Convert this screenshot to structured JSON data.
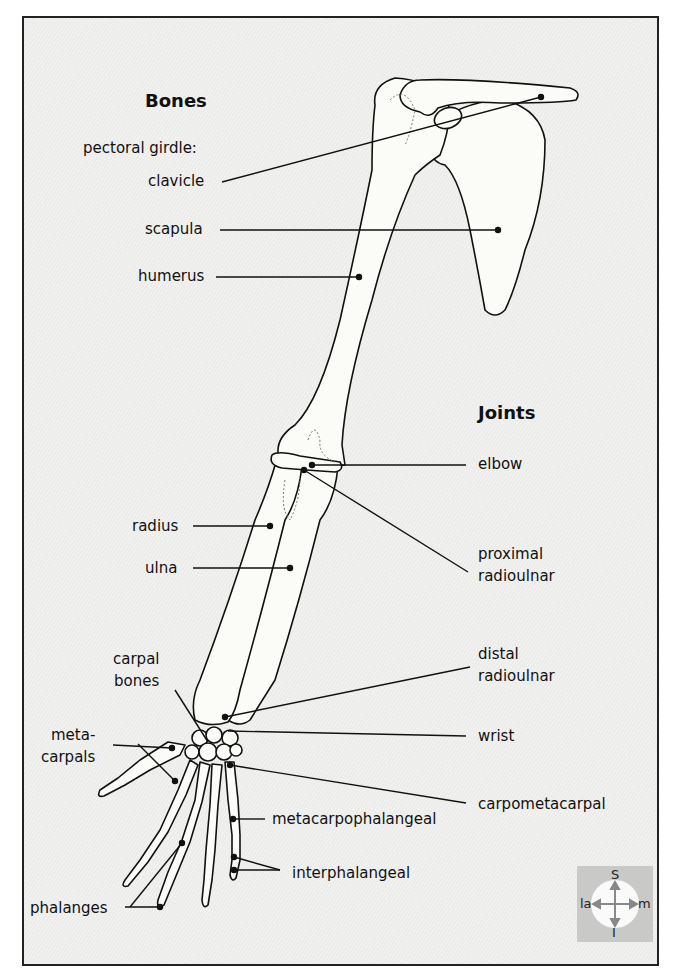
{
  "headers": {
    "bones": "Bones",
    "joints": "Joints"
  },
  "bones": {
    "pectoral_girdle": "pectoral girdle:",
    "clavicle": "clavicle",
    "scapula": "scapula",
    "humerus": "humerus",
    "radius": "radius",
    "ulna": "ulna",
    "carpal_1": "carpal",
    "carpal_2": "bones",
    "meta_1": "meta-",
    "meta_2": "carpals",
    "phalanges": "phalanges"
  },
  "joints": {
    "elbow": "elbow",
    "proximal_1": "proximal",
    "proximal_2": "radioulnar",
    "distal_1": "distal",
    "distal_2": "radioulnar",
    "wrist": "wrist",
    "carpometacarpal": "carpometacarpal",
    "metacarpophalangeal": "metacarpophalangeal",
    "interphalangeal": "interphalangeal"
  },
  "compass": {
    "superior": "S",
    "inferior": "I",
    "lateral": "la",
    "medial": "m"
  },
  "colors": {
    "background": "#ececea",
    "line": "#111111",
    "bone_fill": "#fbfbf8",
    "compass_bg": "#c9c9c7"
  }
}
